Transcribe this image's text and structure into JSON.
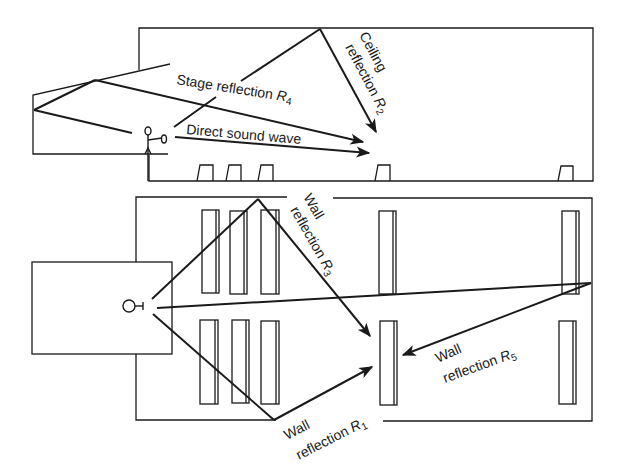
{
  "diagram": {
    "colors": {
      "line": "#1a1a1a",
      "background": "#ffffff"
    },
    "section_view": {
      "labels": {
        "stage_reflection": "Stage reflection ",
        "stage_reflection_var": "R",
        "stage_reflection_sub": "4",
        "direct_sound": "Direct sound wave",
        "ceiling_line1": "Ceiling",
        "ceiling_line2": "reflection ",
        "ceiling_var": "R",
        "ceiling_sub": "2"
      }
    },
    "plan_view": {
      "labels": {
        "wall_r3_line1": "Wall",
        "wall_r3_line2": "reflection ",
        "wall_r3_var": "R",
        "wall_r3_sub": "3",
        "wall_r1_line1": "Wall",
        "wall_r1_line2": "reflection ",
        "wall_r1_var": "R",
        "wall_r1_sub": "1",
        "wall_r5_line1": "Wall",
        "wall_r5_line2": "reflection ",
        "wall_r5_var": "R",
        "wall_r5_sub": "5"
      }
    }
  }
}
